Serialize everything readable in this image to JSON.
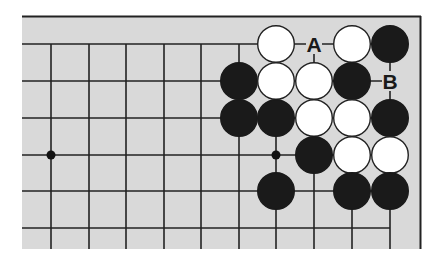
{
  "diagram": {
    "type": "go-board-fragment",
    "board_color": "#d9d9d9",
    "line_color": "#222222",
    "columns_x": [
      51,
      89,
      126,
      164,
      201,
      239,
      276,
      314,
      352,
      390
    ],
    "rows_y": [
      44,
      81,
      118,
      155,
      191,
      228
    ],
    "star_points": [
      [
        0,
        3
      ],
      [
        6,
        3
      ]
    ],
    "stones": [
      {
        "color": "white",
        "col": 6,
        "row": 0
      },
      {
        "color": "white",
        "col": 8,
        "row": 0
      },
      {
        "color": "black",
        "col": 9,
        "row": 0
      },
      {
        "color": "black",
        "col": 5,
        "row": 1
      },
      {
        "color": "white",
        "col": 6,
        "row": 1
      },
      {
        "color": "white",
        "col": 7,
        "row": 1
      },
      {
        "color": "black",
        "col": 8,
        "row": 1
      },
      {
        "color": "black",
        "col": 5,
        "row": 2
      },
      {
        "color": "black",
        "col": 6,
        "row": 2
      },
      {
        "color": "white",
        "col": 7,
        "row": 2
      },
      {
        "color": "white",
        "col": 8,
        "row": 2
      },
      {
        "color": "black",
        "col": 9,
        "row": 2
      },
      {
        "color": "black",
        "col": 7,
        "row": 3
      },
      {
        "color": "white",
        "col": 8,
        "row": 3
      },
      {
        "color": "white",
        "col": 9,
        "row": 3
      },
      {
        "color": "black",
        "col": 6,
        "row": 4
      },
      {
        "color": "black",
        "col": 8,
        "row": 4
      },
      {
        "color": "black",
        "col": 9,
        "row": 4
      }
    ],
    "labels": [
      {
        "text": "A",
        "col": 7,
        "row": 0
      },
      {
        "text": "B",
        "col": 9,
        "row": 1
      }
    ]
  }
}
